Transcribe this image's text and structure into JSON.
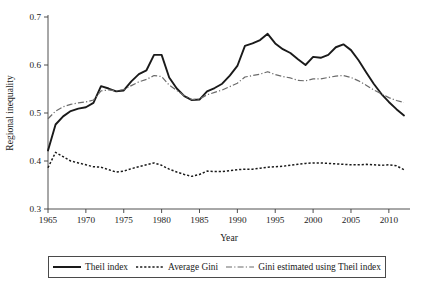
{
  "chart_data": {
    "type": "line",
    "title": "",
    "xlabel": "Year",
    "ylabel": "Regional inequality",
    "xlim": [
      1965,
      2012
    ],
    "ylim": [
      0.3,
      0.7
    ],
    "grid": false,
    "legend_position": "bottom",
    "xticks": [
      1965,
      1970,
      1975,
      1980,
      1985,
      1990,
      1995,
      2000,
      2005,
      2010
    ],
    "xtick_labels": [
      "1965",
      "1970",
      "1975",
      "1980",
      "1985",
      "1990",
      "1995",
      "2000",
      "2005",
      "2010"
    ],
    "yticks": [
      0.3,
      0.4,
      0.5,
      0.6,
      0.7
    ],
    "ytick_labels": [
      "0.3",
      "0.4",
      "0.5",
      "0.6",
      "0.7"
    ],
    "x": [
      1965,
      1966,
      1967,
      1968,
      1969,
      1970,
      1971,
      1972,
      1973,
      1974,
      1975,
      1976,
      1977,
      1978,
      1979,
      1980,
      1981,
      1982,
      1983,
      1984,
      1985,
      1986,
      1987,
      1988,
      1989,
      1990,
      1991,
      1992,
      1993,
      1994,
      1995,
      1996,
      1997,
      1998,
      1999,
      2000,
      2001,
      2002,
      2003,
      2004,
      2005,
      2006,
      2007,
      2008,
      2009,
      2010,
      2011,
      2012
    ],
    "series": [
      {
        "name": "Theil index",
        "style": "solid",
        "color": "#1a1a1a",
        "values": [
          0.422,
          0.476,
          0.493,
          0.504,
          0.509,
          0.512,
          0.521,
          0.556,
          0.551,
          0.545,
          0.547,
          0.566,
          0.581,
          0.589,
          0.621,
          0.621,
          0.574,
          0.551,
          0.535,
          0.527,
          0.528,
          0.545,
          0.552,
          0.561,
          0.578,
          0.598,
          0.64,
          0.645,
          0.652,
          0.665,
          0.645,
          0.633,
          0.625,
          0.612,
          0.6,
          0.617,
          0.615,
          0.621,
          0.637,
          0.643,
          0.631,
          0.61,
          0.585,
          0.561,
          0.54,
          0.523,
          0.508,
          0.495
        ]
      },
      {
        "name": "Average Gini",
        "style": "dotted",
        "color": "#1a1a1a",
        "values": [
          0.386,
          0.418,
          0.409,
          0.4,
          0.396,
          0.392,
          0.388,
          0.387,
          0.382,
          0.377,
          0.379,
          0.384,
          0.388,
          0.392,
          0.396,
          0.391,
          0.383,
          0.377,
          0.372,
          0.368,
          0.372,
          0.379,
          0.378,
          0.378,
          0.38,
          0.382,
          0.383,
          0.383,
          0.385,
          0.387,
          0.388,
          0.389,
          0.391,
          0.393,
          0.395,
          0.396,
          0.396,
          0.395,
          0.394,
          0.393,
          0.392,
          0.392,
          0.393,
          0.392,
          0.391,
          0.392,
          0.39,
          0.382
        ]
      },
      {
        "name": "Gini estimated using Theil index",
        "style": "dash-dot",
        "color": "#6b6b6b",
        "values": [
          0.488,
          0.504,
          0.513,
          0.518,
          0.521,
          0.523,
          0.527,
          0.546,
          0.548,
          0.546,
          0.549,
          0.557,
          0.565,
          0.57,
          0.578,
          0.576,
          0.558,
          0.547,
          0.536,
          0.528,
          0.529,
          0.538,
          0.543,
          0.548,
          0.555,
          0.562,
          0.575,
          0.578,
          0.581,
          0.586,
          0.58,
          0.576,
          0.573,
          0.568,
          0.567,
          0.571,
          0.571,
          0.574,
          0.577,
          0.578,
          0.574,
          0.567,
          0.558,
          0.548,
          0.54,
          0.532,
          0.526,
          0.522
        ]
      }
    ]
  },
  "legend": {
    "items": [
      {
        "label": "Theil index",
        "style": "solid"
      },
      {
        "label": "Average Gini",
        "style": "dotted"
      },
      {
        "label": "Gini estimated using Theil index",
        "style": "dash-dot"
      }
    ]
  },
  "axes": {
    "x_title": "Year",
    "y_title": "Regional inequality"
  }
}
